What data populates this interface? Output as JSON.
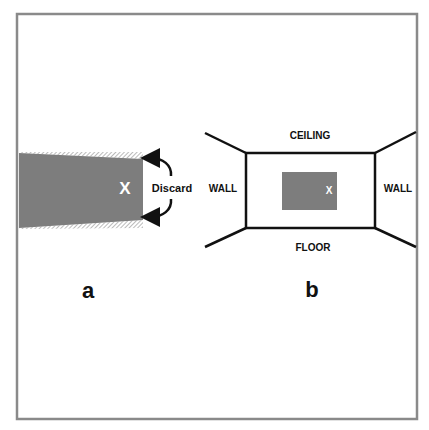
{
  "figure": {
    "frame_color": "#8a8a8a",
    "shade_color": "#7a7a7a",
    "line_color": "#111111"
  },
  "panel_a": {
    "label": "a",
    "marker": "X",
    "discard_label": "Discard"
  },
  "panel_b": {
    "label": "b",
    "marker": "X",
    "ceiling_label": "CEILING",
    "floor_label": "FLOOR",
    "left_wall_label": "WALL",
    "right_wall_label": "WALL"
  }
}
